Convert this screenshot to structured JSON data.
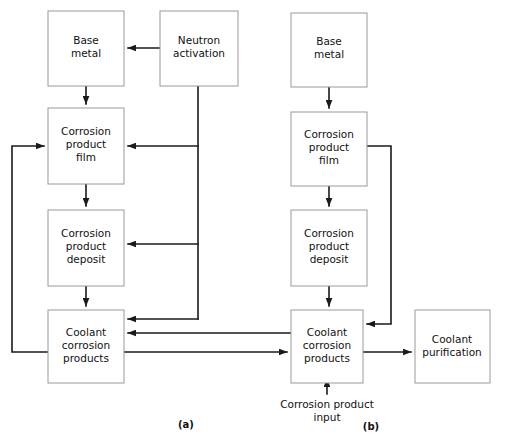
{
  "figure": {
    "background_color": "#ffffff",
    "box_border_color": "#9a9a9a",
    "line_color": "#1a1a1a",
    "text_color": "#111111",
    "width": 505,
    "height": 446
  },
  "panels": [
    {
      "id": "a",
      "caption": "(a)",
      "caption_x": 186,
      "caption_y": 428,
      "boxes": [
        {
          "id": "a-base-metal",
          "lines": [
            "Base",
            "metal"
          ],
          "x": 48,
          "y": 11,
          "w": 76,
          "h": 75
        },
        {
          "id": "a-neutron-activation",
          "lines": [
            "Neutron",
            "activation"
          ],
          "x": 160,
          "y": 11,
          "w": 78,
          "h": 75
        },
        {
          "id": "a-film",
          "lines": [
            "Corrosion",
            "product",
            "film"
          ],
          "x": 48,
          "y": 108,
          "w": 76,
          "h": 76
        },
        {
          "id": "a-deposit",
          "lines": [
            "Corrosion",
            "product",
            "deposit"
          ],
          "x": 48,
          "y": 210,
          "w": 76,
          "h": 76
        },
        {
          "id": "a-coolant",
          "lines": [
            "Coolant",
            "corrosion",
            "products"
          ],
          "x": 48,
          "y": 310,
          "w": 76,
          "h": 73
        }
      ]
    },
    {
      "id": "b",
      "caption": "(b)",
      "caption_x": 371,
      "caption_y": 430,
      "boxes": [
        {
          "id": "b-base-metal",
          "lines": [
            "Base",
            "metal"
          ],
          "x": 291,
          "y": 13,
          "w": 76,
          "h": 74
        },
        {
          "id": "b-film",
          "lines": [
            "Corrosion",
            "product",
            "film"
          ],
          "x": 291,
          "y": 112,
          "w": 76,
          "h": 74
        },
        {
          "id": "b-deposit",
          "lines": [
            "Corrosion",
            "product",
            "deposit"
          ],
          "x": 291,
          "y": 210,
          "w": 76,
          "h": 76
        },
        {
          "id": "b-coolant",
          "lines": [
            "Coolant",
            "corrosion",
            "products"
          ],
          "x": 291,
          "y": 310,
          "w": 72,
          "h": 73
        },
        {
          "id": "b-purify",
          "lines": [
            "Coolant",
            "purification"
          ],
          "x": 415,
          "y": 310,
          "w": 75,
          "h": 73
        }
      ],
      "free_labels": [
        {
          "id": "b-input-label",
          "lines": [
            "Corrosion product",
            "input"
          ],
          "x": 327,
          "y": 408
        }
      ]
    }
  ],
  "connections": [
    {
      "id": "a-neutron-to-base",
      "from": "a-neutron-activation",
      "to": "a-base-metal"
    },
    {
      "id": "a-base-to-film",
      "from": "a-base-metal",
      "to": "a-film"
    },
    {
      "id": "a-film-to-deposit",
      "from": "a-film",
      "to": "a-deposit"
    },
    {
      "id": "a-deposit-to-coolant",
      "from": "a-deposit",
      "to": "a-coolant"
    },
    {
      "id": "a-neutron-to-film",
      "from": "a-neutron-activation",
      "to": "a-film"
    },
    {
      "id": "a-neutron-to-deposit",
      "from": "a-neutron-activation",
      "to": "a-deposit"
    },
    {
      "id": "a-neutron-to-coolant",
      "from": "a-neutron-activation",
      "to": "a-coolant"
    },
    {
      "id": "a-coolant-to-film",
      "from": "a-coolant",
      "to": "a-film"
    },
    {
      "id": "a-coolant-to-b-coolant",
      "from": "a-coolant",
      "to": "b-coolant"
    },
    {
      "id": "a-coolant-out-lower",
      "from": "a-coolant",
      "to": "b-coolant"
    },
    {
      "id": "b-base-to-film",
      "from": "b-base-metal",
      "to": "b-film"
    },
    {
      "id": "b-film-to-deposit",
      "from": "b-film",
      "to": "b-deposit"
    },
    {
      "id": "b-deposit-to-coolant",
      "from": "b-deposit",
      "to": "b-coolant"
    },
    {
      "id": "b-film-to-coolant",
      "from": "b-film",
      "to": "b-coolant"
    },
    {
      "id": "b-coolant-to-purify",
      "from": "b-coolant",
      "to": "b-purify"
    },
    {
      "id": "b-input-to-coolant",
      "from": "b-input-label",
      "to": "b-coolant"
    }
  ]
}
